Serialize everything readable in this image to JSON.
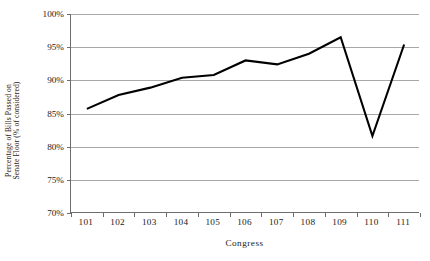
{
  "chart_data": {
    "type": "line",
    "title": "",
    "xlabel": "Congress",
    "ylabel": "Percentage of Bills Passed on Senate Floor (% of considered)",
    "ylabel_lines": [
      "Percentage of Bills Passed on",
      "Senate Floor (% of considered)"
    ],
    "categories": [
      "101",
      "102",
      "103",
      "104",
      "105",
      "106",
      "107",
      "108",
      "109",
      "110",
      "111"
    ],
    "values": [
      85.7,
      87.8,
      88.9,
      90.4,
      90.8,
      93.0,
      92.4,
      94.0,
      96.5,
      81.6,
      95.4
    ],
    "series": [
      {
        "name": "Percentage of Bills Passed on Senate Floor",
        "values": [
          85.7,
          87.8,
          88.9,
          90.4,
          90.8,
          93.0,
          92.4,
          94.0,
          96.5,
          81.6,
          95.4
        ]
      }
    ],
    "ylim": [
      70,
      100
    ],
    "ytick_step": 5,
    "ytick_labels": [
      "100%",
      "95%",
      "90%",
      "85%",
      "80%",
      "75%",
      "70%"
    ],
    "ytick_values": [
      100,
      95,
      90,
      85,
      80,
      75,
      70
    ],
    "grid": true,
    "grid_axis": "y",
    "legend": false,
    "legend_position": "none",
    "markers": false,
    "line_color": "#000000",
    "grid_color": "#a8a8a8",
    "axis_color": "#6d6d6d",
    "background_color": "#ffffff",
    "line_width": 2.1
  }
}
